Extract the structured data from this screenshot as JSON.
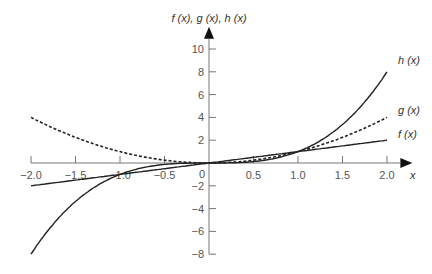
{
  "chart_data": {
    "type": "line",
    "title": "",
    "xlabel": "x",
    "ylabel": "f (x), g (x), h (x)",
    "xlim": [
      -2.0,
      2.0
    ],
    "ylim": [
      -8,
      10
    ],
    "grid": false,
    "legend": "inline labels at right end of curves",
    "x_ticks": [
      "-2.0",
      "-1.5",
      "-1.0",
      "-0.5",
      "0",
      "0.5",
      "1.0",
      "1.5",
      "2.0"
    ],
    "y_ticks": [
      "10",
      "8",
      "6",
      "4",
      "2",
      "-2",
      "-4",
      "-6",
      "-8"
    ],
    "x": [
      -2.0,
      -1.5,
      -1.0,
      -0.5,
      0,
      0.5,
      1.0,
      1.5,
      2.0
    ],
    "series": [
      {
        "name": "f (x)",
        "style": "solid",
        "values": [
          -2.0,
          -1.5,
          -1.0,
          -0.5,
          0,
          0.5,
          1.0,
          1.5,
          2.0
        ]
      },
      {
        "name": "g (x)",
        "style": "dashed",
        "values": [
          4.0,
          2.25,
          1.0,
          0.25,
          0,
          0.25,
          1.0,
          2.25,
          4.0
        ]
      },
      {
        "name": "h (x)",
        "style": "solid",
        "values": [
          -8.0,
          -3.375,
          -1.0,
          -0.125,
          0,
          0.125,
          1.0,
          3.375,
          8.0
        ]
      }
    ]
  },
  "labels": {
    "y_axis_title": "f (x), g (x), h (x)",
    "x_axis_title": "x",
    "f": "f (x)",
    "g": "g (x)",
    "h": "h (x)",
    "origin": "0"
  }
}
